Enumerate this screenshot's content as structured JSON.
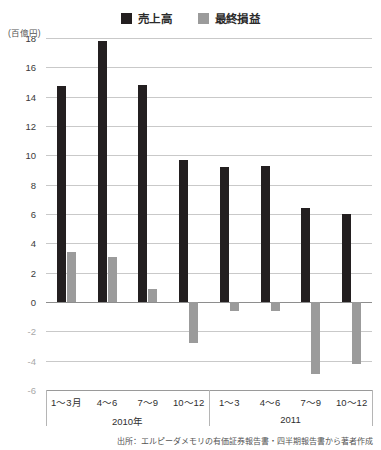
{
  "legend": {
    "entries": [
      {
        "label": "売上高",
        "color": "#231f20",
        "icon": "square-swatch-dark"
      },
      {
        "label": "最終損益",
        "color": "#9b9b9b",
        "icon": "square-swatch-gray"
      }
    ]
  },
  "unit_caption": "(百億円)",
  "source_note": "出所：エルピーダメモリの有価証券報告書・四半期報告書から著者作成",
  "yaxis": {
    "ticks": [
      "18",
      "16",
      "14",
      "12",
      "10",
      "8",
      "6",
      "4",
      "2",
      "0",
      "-2",
      "-4",
      "-6"
    ]
  },
  "xaxis": {
    "quarters": [
      "1〜3月",
      "4〜6",
      "7〜9",
      "10〜12",
      "1〜3",
      "4〜6",
      "7〜9",
      "10〜12"
    ],
    "years": [
      "2010年",
      "2011"
    ]
  },
  "chart_data": {
    "type": "bar",
    "title": "",
    "subtitle": "",
    "xlabel": "",
    "ylabel": "(百億円)",
    "ylim": [
      -6,
      18
    ],
    "ytick_step": 2,
    "grid": true,
    "legend_position": "top-center",
    "categories": [
      "1〜3月",
      "4〜6",
      "7〜9",
      "10〜12",
      "1〜3",
      "4〜6",
      "7〜9",
      "10〜12"
    ],
    "group_labels": [
      "2010年",
      "2010年",
      "2010年",
      "2010年",
      "2011",
      "2011",
      "2011",
      "2011"
    ],
    "series": [
      {
        "name": "売上高",
        "color": "#231f20",
        "values": [
          14.7,
          17.8,
          14.8,
          9.7,
          9.2,
          9.3,
          6.4,
          6.0
        ]
      },
      {
        "name": "最終損益",
        "color": "#9b9b9b",
        "values": [
          3.4,
          3.1,
          0.9,
          -2.8,
          -0.6,
          -0.6,
          -4.9,
          -4.2
        ]
      }
    ],
    "source": "出所：エルピーダメモリの有価証券報告書・四半期報告書から著者作成"
  }
}
